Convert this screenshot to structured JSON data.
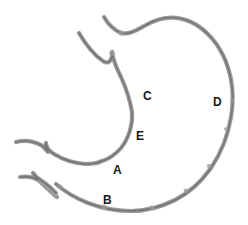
{
  "figure": {
    "background_color": "#ffffff",
    "outline_color": "#9b9b9b",
    "outline_shadow_color": "#6f6f6f",
    "outline_highlight_color": "#d6d6d6",
    "label_color": "#191919",
    "width": 248,
    "height": 225
  },
  "labels": [
    {
      "id": "A",
      "text": "A",
      "x": 113,
      "y": 164,
      "region": "pylorus"
    },
    {
      "id": "B",
      "text": "B",
      "x": 103,
      "y": 194,
      "region": "greater-curvature-lower"
    },
    {
      "id": "C",
      "text": "C",
      "x": 143,
      "y": 90,
      "region": "body"
    },
    {
      "id": "D",
      "text": "D",
      "x": 213,
      "y": 96,
      "region": "greater-curvature"
    },
    {
      "id": "E",
      "text": "E",
      "x": 136,
      "y": 130,
      "region": "antrum"
    }
  ],
  "strokes": {
    "esophagus_upper": "M 79 33 C 86 45, 94 55, 103 61 C 110 66, 113 57, 112 52 C 113 61, 117 69, 121 77 C 126 88, 130 100, 132 112 C 133 124, 129 138, 121 148 C 115 155, 107 160, 99 162",
    "cardia_fundus_greater": "M 104 17 C 108 24, 114 30, 121 33 C 129 35, 137 30, 146 25 C 160 17, 176 15, 191 22 C 206 29, 219 44, 226 62 C 233 80, 234 99, 231 117 C 228 136, 221 153, 211 168 C 201 182, 189 193, 175 200 C 161 207, 146 211, 131 211 C 116 211, 101 208, 88 203 C 75 198, 64 191, 56 184",
    "duodenum_upper": "M 16 142 C 24 140, 33 141, 41 145 C 44 147, 46 150, 48 152 C 46 149, 45 145, 46 143 C 46 147, 49 151, 54 154 C 62 159, 73 163, 85 164 C 92 164, 97 163, 100 162",
    "duodenum_lower_branch": "M 20 177 C 27 176, 33 177, 38 180 C 36 177, 34 175, 33 173 C 35 176, 38 179, 42 181 C 47 184, 52 189, 56 193",
    "duodenum_lower_main": "M 38 180 C 45 186, 52 193, 57 197"
  },
  "rugae_bumps": [
    {
      "cx": 60,
      "cy": 187,
      "r": 2.5
    },
    {
      "cx": 104,
      "cy": 207,
      "r": 2.6
    },
    {
      "cx": 152,
      "cy": 208,
      "r": 2.4
    },
    {
      "cx": 186,
      "cy": 191,
      "r": 2.4
    },
    {
      "cx": 209,
      "cy": 166,
      "r": 2.2
    },
    {
      "cx": 226,
      "cy": 129,
      "r": 2.0
    },
    {
      "cx": 232,
      "cy": 101,
      "r": 2.0
    },
    {
      "cx": 112,
      "cy": 53,
      "r": 2.8
    },
    {
      "cx": 121,
      "cy": 33,
      "r": 2.6
    }
  ]
}
